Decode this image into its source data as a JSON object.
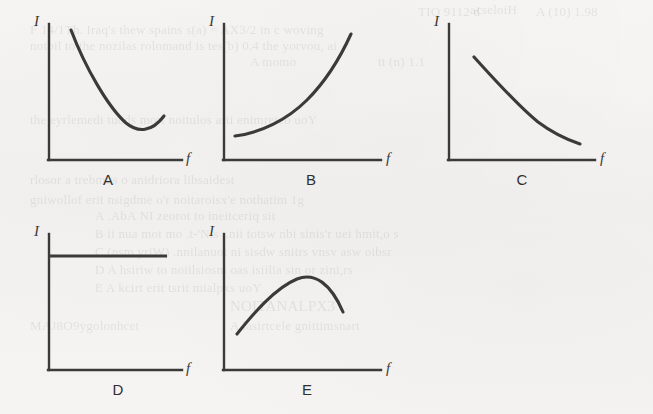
{
  "figure": {
    "kind": "multi-panel-line-graphs",
    "panel_count": 5,
    "axis_labels": {
      "y": "I",
      "x": "f"
    },
    "background_color": "#f4f3f1",
    "ink_color": "#3a3a3a",
    "bleed_text_color": "#2a2a2a"
  },
  "panels": [
    {
      "letter": "A",
      "y_label": "I",
      "x_label": "f",
      "shape": "u-shaped-decreasing-then-increasing"
    },
    {
      "letter": "B",
      "y_label": "I",
      "x_label": "f",
      "shape": "increasing-convex"
    },
    {
      "letter": "C",
      "y_label": "I",
      "x_label": "f",
      "shape": "decreasing-convex"
    },
    {
      "letter": "D",
      "y_label": "I",
      "x_label": "f",
      "shape": "horizontal-constant"
    },
    {
      "letter": "E",
      "y_label": "I",
      "x_label": "f",
      "shape": "inverted-u-peak"
    }
  ],
  "bleed_text": [
    {
      "text": "acseloiH",
      "x": 470,
      "y": 2,
      "size": 13
    },
    {
      "text": "A (10) 1.98",
      "x": 536,
      "y": 4,
      "size": 13
    },
    {
      "text": "TIO 9112 d",
      "x": 418,
      "y": 4,
      "size": 13
    },
    {
      "text": "F 14/1Th. Iraq's thew spains s(a) = AX3/2 in c woving",
      "x": 30,
      "y": 22,
      "size": 13
    },
    {
      "text": "notoil to the nozilas rolomand is tes(b) 0.4 the yorvou, ai",
      "x": 30,
      "y": 38,
      "size": 13
    },
    {
      "text": "A momo",
      "x": 250,
      "y": 54,
      "size": 13
    },
    {
      "text": "tt (n) 1.1",
      "x": 378,
      "y": 54,
      "size": 13
    },
    {
      "text": "the eyrlemedi tuods mort noitulos arti enimreteb uoY",
      "x": 30,
      "y": 112,
      "size": 13
    },
    {
      "text": "rlosor a trebmus o anidriora libsaidest",
      "x": 30,
      "y": 172,
      "size": 13
    },
    {
      "text": "gniwollof erit nsigdme o'r noitaroisx'e nothatim 1g",
      "x": 30,
      "y": 192,
      "size": 13
    },
    {
      "text": "A .AbA NI zeorot to ineitceriq sit",
      "x": 95,
      "y": 208,
      "size": 13
    },
    {
      "text": "B  ii nua mot mo .t-'N.s ..nii totsw nbi sinis'r uei hmit,o s",
      "x": 95,
      "y": 226,
      "size": 13
    },
    {
      "text": "C   (nsm yriW) .nnilanuot ni sisdw snitrs vnsv asw oibsr",
      "x": 95,
      "y": 244,
      "size": 13
    },
    {
      "text": "D   A hsiriw to noiilsiosm oas isiilia sin or zini,rs",
      "x": 95,
      "y": 262,
      "size": 13
    },
    {
      "text": "E   A kcirt erit tsrit mialpxs uoY",
      "x": 95,
      "y": 280,
      "size": 13
    },
    {
      "text": "NOITANALPX3",
      "x": 230,
      "y": 298,
      "size": 15
    },
    {
      "text": "MAJ8O9ygolonhcet",
      "x": 30,
      "y": 318,
      "size": 13
    },
    {
      "text": "A lasirtcele gnittimsnart",
      "x": 230,
      "y": 318,
      "size": 13
    }
  ]
}
